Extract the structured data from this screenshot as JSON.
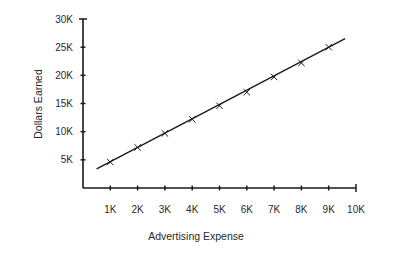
{
  "chart_data": {
    "type": "line",
    "title": "",
    "xlabel": "Advertising Expense",
    "ylabel": "Dollars Earned",
    "x_ticks": [
      "1K",
      "2K",
      "3K",
      "4K",
      "5K",
      "6K",
      "7K",
      "8K",
      "9K",
      "10K"
    ],
    "y_ticks": [
      "5K",
      "10K",
      "15K",
      "20K",
      "25K",
      "30K"
    ],
    "xlim": [
      0,
      10000
    ],
    "ylim": [
      0,
      30000
    ],
    "grid": false,
    "legend": null,
    "series": [
      {
        "name": "Dollars Earned vs Advertising Expense",
        "marker": "x",
        "x": [
          1000,
          2000,
          3000,
          4000,
          5000,
          6000,
          7000,
          8000,
          9000
        ],
        "y": [
          4600,
          7200,
          9700,
          12200,
          14600,
          17000,
          19700,
          22200,
          25000
        ]
      }
    ],
    "trend_line": {
      "x_start": 500,
      "y_start": 3400,
      "x_end": 9600,
      "y_end": 26500
    }
  },
  "colors": {
    "ink": "#1a1a1a",
    "background": "#ffffff"
  }
}
